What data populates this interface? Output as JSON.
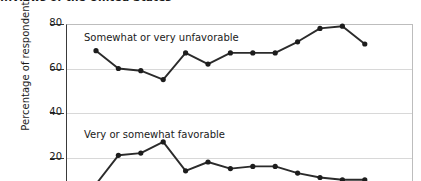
{
  "chart": {
    "title": "...views of the United States",
    "y_axis_title": "Percentage of respondents",
    "y_ticks": [
      "80",
      "60",
      "40",
      "20"
    ],
    "series_label_unfavorable": "Somewhat or very unfavorable",
    "series_label_favorable": "Very or somewhat favorable"
  },
  "chart_data": {
    "type": "line",
    "title": "...views of the United States",
    "xlabel": "",
    "ylabel": "Percentage of respondents",
    "ylim": [
      0,
      80
    ],
    "yticks": [
      20,
      40,
      60,
      80
    ],
    "grid": true,
    "legend": "inline-labels",
    "x": [
      1,
      2,
      3,
      4,
      5,
      6,
      7,
      8,
      9,
      10,
      11,
      12,
      13
    ],
    "series": [
      {
        "name": "Somewhat or very unfavorable",
        "color": "#2b2b2b",
        "values": [
          68,
          60,
          59,
          55,
          67,
          62,
          67,
          67,
          67,
          72,
          78,
          79,
          71
        ]
      },
      {
        "name": "Very or somewhat favorable",
        "color": "#2b2b2b",
        "values": [
          8,
          21,
          22,
          27,
          14,
          18,
          15,
          16,
          16,
          13,
          11,
          10,
          10
        ]
      }
    ]
  }
}
